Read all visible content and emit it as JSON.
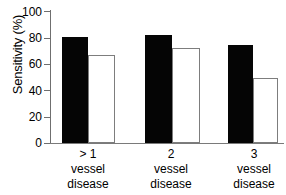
{
  "chart_data": {
    "type": "bar",
    "title": "",
    "xlabel": "",
    "ylabel": "Sensitivity (%)",
    "ylim": [
      0,
      100
    ],
    "yticks": [
      0,
      20,
      40,
      60,
      80,
      100
    ],
    "ytick_labels": [
      "0",
      "20",
      "40",
      "60",
      "80",
      "100"
    ],
    "grid": false,
    "legend": null,
    "categories": [
      {
        "line1": "> 1",
        "line2": "vessel",
        "line3": "disease"
      },
      {
        "line1": "2",
        "line2": "vessel",
        "line3": "disease"
      },
      {
        "line1": "3",
        "line2": "vessel",
        "line3": "disease"
      }
    ],
    "category_labels": [
      "> 1 vessel disease",
      "2 vessel disease",
      "3 vessel disease"
    ],
    "series": [
      {
        "name": "filled",
        "style": "solid-black",
        "color": "#050505",
        "values": [
          80,
          82,
          74
        ]
      },
      {
        "name": "open",
        "style": "open-white",
        "color": "#ffffff",
        "edge_color": "#7d7d7d",
        "values": [
          67,
          72,
          49
        ]
      }
    ],
    "axis_color": "#6f6f6f"
  }
}
